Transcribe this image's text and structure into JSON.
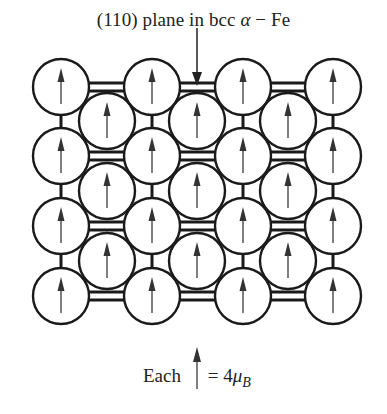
{
  "title": {
    "prefix": "(110) plane in bcc ",
    "greek": "α",
    "suffix": " − Fe"
  },
  "lattice": {
    "structure": "bcc (110) plane",
    "element": "Fe",
    "corner_columns_x": [
      61,
      152,
      243,
      333
    ],
    "corner_rows_y": [
      87,
      156,
      226,
      296
    ],
    "center_columns_x": [
      107,
      197,
      288
    ],
    "center_rows_y": [
      121,
      191,
      261
    ],
    "atom_radius": 28,
    "spin_direction": "up",
    "atom_count": 25,
    "line_color": "#1a1a1a",
    "arrow_color": "#444444"
  },
  "pointer_arrow": {
    "label": "points to (110) plane",
    "x": 197,
    "y_start": 26,
    "y_end": 87
  },
  "caption": {
    "prefix": "Each",
    "equals": "= 4",
    "mu": "μ",
    "subscript": "B"
  }
}
